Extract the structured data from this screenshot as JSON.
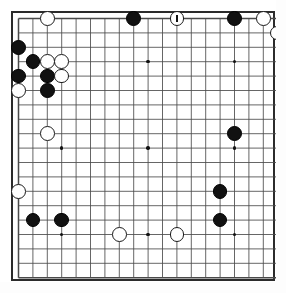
{
  "app": {
    "title": "Go Board Diagram",
    "board_type": "go-board",
    "size": 19
  },
  "board": {
    "columns": 19,
    "rows": 19,
    "line_color": "#4a4a4a",
    "border_color": "#2b2b2b",
    "background_color": "#ffffff",
    "black_stone_color": "#111111",
    "white_stone_color": "#ffffff",
    "origin_x": 18.5,
    "origin_y": 18.5,
    "spacing": 14.4,
    "stone_radius": 7.4,
    "frame_left": 11,
    "frame_top": 11,
    "frame_width": 264,
    "frame_height": 270,
    "hoshi": [
      {
        "col": 3,
        "row": 3
      },
      {
        "col": 9,
        "row": 3
      },
      {
        "col": 15,
        "row": 3
      },
      {
        "col": 3,
        "row": 9
      },
      {
        "col": 9,
        "row": 9
      },
      {
        "col": 15,
        "row": 9
      },
      {
        "col": 3,
        "row": 15
      },
      {
        "col": 9,
        "row": 15
      },
      {
        "col": 15,
        "row": 15
      }
    ]
  },
  "stones": [
    {
      "col": 3,
      "row": 1,
      "color": "white",
      "marked": false
    },
    {
      "col": 9,
      "row": 1,
      "color": "black",
      "marked": false
    },
    {
      "col": 12,
      "row": 1,
      "color": "white",
      "marked": true
    },
    {
      "col": 16,
      "row": 1,
      "color": "black",
      "marked": false
    },
    {
      "col": 18,
      "row": 1,
      "color": "white",
      "marked": false
    },
    {
      "col": 1,
      "row": 3,
      "color": "black",
      "marked": false
    },
    {
      "col": 19,
      "row": 2,
      "color": "white",
      "marked": false
    },
    {
      "col": 2,
      "row": 4,
      "color": "black",
      "marked": false
    },
    {
      "col": 3,
      "row": 4,
      "color": "white",
      "marked": false
    },
    {
      "col": 4,
      "row": 4,
      "color": "white",
      "marked": false
    },
    {
      "col": 1,
      "row": 5,
      "color": "black",
      "marked": false
    },
    {
      "col": 3,
      "row": 5,
      "color": "black",
      "marked": false
    },
    {
      "col": 4,
      "row": 5,
      "color": "white",
      "marked": false
    },
    {
      "col": 1,
      "row": 6,
      "color": "white",
      "marked": false
    },
    {
      "col": 3,
      "row": 6,
      "color": "black",
      "marked": false
    },
    {
      "col": 3,
      "row": 9,
      "color": "white",
      "marked": false
    },
    {
      "col": 16,
      "row": 9,
      "color": "black",
      "marked": false
    },
    {
      "col": 1,
      "row": 13,
      "color": "white",
      "marked": false
    },
    {
      "col": 15,
      "row": 13,
      "color": "black",
      "marked": false
    },
    {
      "col": 2,
      "row": 15,
      "color": "black",
      "marked": false
    },
    {
      "col": 4,
      "row": 15,
      "color": "black",
      "marked": false
    },
    {
      "col": 15,
      "row": 15,
      "color": "black",
      "marked": false
    },
    {
      "col": 8,
      "row": 16,
      "color": "white",
      "marked": false
    },
    {
      "col": 12,
      "row": 16,
      "color": "white",
      "marked": false
    }
  ],
  "legend": {
    "marked_stone_label": "last move",
    "black_label": "Black",
    "white_label": "White"
  }
}
